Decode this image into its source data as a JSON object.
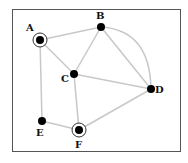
{
  "diagram": {
    "type": "graph",
    "colors": {
      "edge": "#c8c8c8",
      "node": "#000000",
      "frame": "#555555",
      "ring": "#333333"
    },
    "nodes": [
      {
        "id": "A",
        "label": "A",
        "x": 40,
        "y": 40,
        "ringed": true
      },
      {
        "id": "B",
        "label": "B",
        "x": 101,
        "y": 27,
        "ringed": false
      },
      {
        "id": "C",
        "label": "C",
        "x": 74,
        "y": 74,
        "ringed": false
      },
      {
        "id": "D",
        "label": "D",
        "x": 151,
        "y": 89,
        "ringed": false
      },
      {
        "id": "E",
        "label": "E",
        "x": 42,
        "y": 121,
        "ringed": false
      },
      {
        "id": "F",
        "label": "F",
        "x": 79,
        "y": 130,
        "ringed": true
      }
    ],
    "edges": [
      [
        "A",
        "B"
      ],
      [
        "A",
        "C"
      ],
      [
        "A",
        "E"
      ],
      [
        "B",
        "C"
      ],
      [
        "B",
        "D"
      ],
      [
        "C",
        "D"
      ],
      [
        "C",
        "F"
      ],
      [
        "E",
        "F"
      ],
      [
        "F",
        "D"
      ]
    ]
  }
}
